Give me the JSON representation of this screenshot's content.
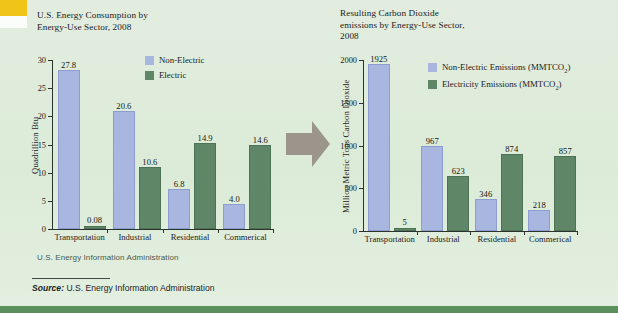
{
  "figure": {
    "source_rule_label": "Source:",
    "source_text": " U.S. Energy Information Administration",
    "small_source": "U.S. Energy Information Administration",
    "arrow_icon": "right-arrow-icon",
    "colors": {
      "background": "#dfebdc",
      "non_electric": "#a9b6e0",
      "electric": "#5f8667",
      "arrow": "#9c958b",
      "bottom_rule": "#5b8f5d",
      "top_accent": "#f0c419"
    }
  },
  "chart_data": [
    {
      "type": "bar",
      "id": "energy-consumption",
      "title": "U.S. Energy Consumption by Energy-Use Sector, 2008",
      "title_lines": [
        "U.S. Energy Consumption by",
        "Energy-Use Sector, 2008"
      ],
      "xlabel": "",
      "ylabel": "Quadrillion Btu",
      "ylim": [
        0,
        30
      ],
      "yticks": [
        0,
        5,
        10,
        15,
        20,
        25,
        30
      ],
      "ytick_labels": [
        "0",
        "5",
        "10",
        "15",
        "20",
        "25",
        "30"
      ],
      "grid": false,
      "legend_position": "top-right",
      "categories": [
        "Transportation",
        "Industrial",
        "Residential",
        "Commerical"
      ],
      "series": [
        {
          "name": "Non-Electric",
          "color": "#a9b6e0",
          "values": [
            27.8,
            20.6,
            6.8,
            4.0
          ],
          "labels": [
            "27.8",
            "20.6",
            "6.8",
            "4.0"
          ]
        },
        {
          "name": "Electric",
          "color": "#5f8667",
          "values": [
            0.08,
            10.6,
            14.9,
            14.6
          ],
          "labels": [
            "0.08",
            "10.6",
            "14.9",
            "14.6"
          ]
        }
      ]
    },
    {
      "type": "bar",
      "id": "co2-emissions",
      "title": "Resulting Carbon Dioxide emissions by Energy-Use Sector, 2008",
      "title_lines": [
        "Resulting Carbon Dioxide",
        "emissions by Energy-Use Sector,",
        "2008"
      ],
      "xlabel": "",
      "ylabel": "Million Metric Tons Carbon Dioxide",
      "ylim": [
        0,
        2000
      ],
      "yticks": [
        0,
        500,
        1000,
        1500,
        2000
      ],
      "ytick_labels": [
        "0",
        "500",
        "1000",
        "1500",
        "2000"
      ],
      "grid": false,
      "legend_position": "top-right",
      "categories": [
        "Transportation",
        "Industrial",
        "Residential",
        "Commerical"
      ],
      "series": [
        {
          "name": "Non-Electric Emissions (MMTCO2)",
          "name_html": "Non-Electric Emissions (MMTCO₂)",
          "color": "#a9b6e0",
          "values": [
            1925,
            967,
            346,
            218
          ],
          "labels": [
            "1925",
            "967",
            "346",
            "218"
          ]
        },
        {
          "name": "Electricity Emissions (MMTCO2)",
          "name_html": "Electricity Emissions (MMTCO₂)",
          "color": "#5f8667",
          "values": [
            5,
            623,
            874,
            857
          ],
          "labels": [
            "5",
            "623",
            "874",
            "857"
          ]
        }
      ]
    }
  ]
}
